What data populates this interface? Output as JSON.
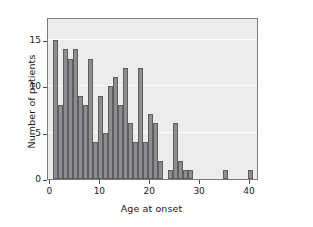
{
  "chart_data": {
    "type": "bar",
    "title": "",
    "subtitle": "",
    "xlabel": "Age at onset",
    "ylabel": "Number of patients",
    "xlim": [
      -0.5,
      41.8
    ],
    "ylim": [
      0,
      17.5
    ],
    "xticks": [
      0,
      10,
      20,
      30,
      40
    ],
    "xtick_labels": [
      "0",
      "10",
      "20",
      "30",
      "40"
    ],
    "yticks": [
      0,
      5,
      10,
      15
    ],
    "ytick_labels": [
      "0",
      "5",
      "10",
      "15"
    ],
    "grid": true,
    "grid_orientation": "horizontal",
    "legend": null,
    "bin_width": 1,
    "bar_color": "#8d8d8f",
    "bar_edge_color": "#5e5e60",
    "plot_bg_color": "#ececed",
    "gridline_color": "#fbfbfb",
    "axis_color": "#7a7a7c",
    "text_color": "#1a1a1a",
    "categories": [
      1,
      2,
      3,
      4,
      5,
      6,
      7,
      8,
      9,
      10,
      11,
      12,
      13,
      14,
      15,
      16,
      17,
      18,
      19,
      20,
      21,
      22,
      24,
      25,
      26,
      27,
      28,
      35,
      40
    ],
    "values": [
      15,
      8,
      14,
      13,
      14,
      9,
      8,
      13,
      4,
      9,
      5,
      10,
      11,
      8,
      12,
      6,
      4,
      12,
      4,
      7,
      6,
      2,
      1,
      6,
      2,
      1,
      1,
      1,
      1
    ]
  }
}
